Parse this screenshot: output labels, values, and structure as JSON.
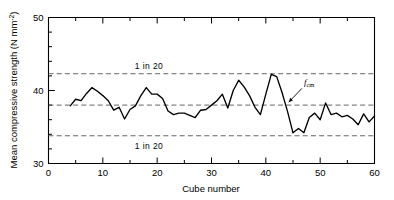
{
  "chart_data": {
    "type": "line",
    "title": "",
    "xlabel": "Cube number",
    "ylabel": "Mean compressive strength (N mm⁻²)",
    "ylabel_main": "Mean compressive strength (N mm",
    "ylabel_sup": "-2",
    "ylabel_tail": ")",
    "xlim": [
      0,
      60
    ],
    "ylim": [
      30,
      50
    ],
    "grid": false,
    "legend": null,
    "xticks": [
      0,
      10,
      20,
      30,
      40,
      50,
      60
    ],
    "xtick_labels": [
      "0",
      "10",
      "20",
      "30",
      "40",
      "50",
      "60"
    ],
    "xminor_step": 5,
    "yticks": [
      30,
      40,
      50
    ],
    "ytick_labels": [
      "30",
      "40",
      "50"
    ],
    "yminor_step": 2,
    "series": [
      {
        "name": "Mean compressive strength",
        "x": [
          4,
          5,
          6,
          7,
          8,
          9,
          10,
          11,
          12,
          13,
          14,
          15,
          16,
          17,
          18,
          19,
          20,
          21,
          22,
          23,
          24,
          25,
          26,
          27,
          28,
          29,
          30,
          31,
          32,
          33,
          34,
          35,
          36,
          37,
          38,
          39,
          40,
          41,
          42,
          43,
          44,
          45,
          46,
          47,
          48,
          49,
          50,
          51,
          52,
          53,
          54,
          55,
          56,
          57,
          58,
          59,
          60
        ],
        "values": [
          37.9,
          38.8,
          38.6,
          39.6,
          40.4,
          39.9,
          39.3,
          38.6,
          37.3,
          37.7,
          36.1,
          37.4,
          37.9,
          39.3,
          40.4,
          39.5,
          39.5,
          38.9,
          37.2,
          36.7,
          36.9,
          36.9,
          36.6,
          36.3,
          37.3,
          37.4,
          38.0,
          38.6,
          39.5,
          37.6,
          40.0,
          41.4,
          40.5,
          39.3,
          37.7,
          36.7,
          39.5,
          42.2,
          41.9,
          39.7,
          37.1,
          34.2,
          34.8,
          34.2,
          36.3,
          36.9,
          36.0,
          38.3,
          36.7,
          36.9,
          36.4,
          36.6,
          36.1,
          35.3,
          36.8,
          35.7,
          36.5
        ]
      }
    ],
    "reference_lines": [
      {
        "name": "upper-1-in-20",
        "value": 42.3,
        "label": "1 in 20",
        "label_x": 18.5,
        "label_above": true
      },
      {
        "name": "mean-fcm",
        "value": 38.0,
        "label": "",
        "label_x": null,
        "label_above": false
      },
      {
        "name": "lower-1-in-20",
        "value": 33.8,
        "label": "1 in 20",
        "label_x": 18.5,
        "label_above": false
      }
    ],
    "annotations": [
      {
        "name": "fcm-annotation",
        "text": "f",
        "subscript": "cm",
        "x": 47.0,
        "y": 40.7,
        "arrow_to_x": 44.2,
        "arrow_to_y": 38.4
      }
    ]
  }
}
